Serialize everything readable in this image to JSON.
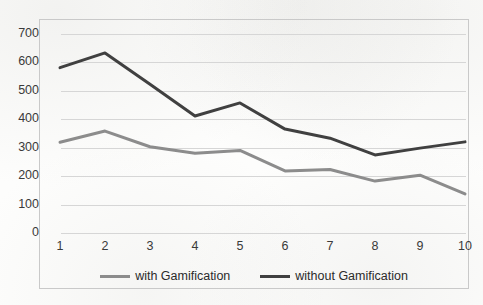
{
  "chart_data": {
    "type": "line",
    "title": "",
    "subtitle": "",
    "xlabel": "",
    "ylabel": "",
    "categories": [
      "1",
      "2",
      "3",
      "4",
      "5",
      "6",
      "7",
      "8",
      "9",
      "10"
    ],
    "x": [
      1,
      2,
      3,
      4,
      5,
      6,
      7,
      8,
      9,
      10
    ],
    "series": [
      {
        "name": "with Gamification",
        "color": "#8c8c8c",
        "values": [
          316,
          355,
          300,
          277,
          287,
          215,
          220,
          179,
          200,
          134
        ]
      },
      {
        "name": "without Gamification",
        "color": "#404040",
        "values": [
          578,
          630,
          520,
          408,
          454,
          362,
          330,
          271,
          295,
          317
        ]
      }
    ],
    "ylim": [
      0,
      700
    ],
    "ytick_step": 100,
    "yticks": [
      "0",
      "100",
      "200",
      "300",
      "400",
      "500",
      "600",
      "700"
    ],
    "xlim": [
      1,
      10
    ],
    "grid": {
      "horizontal": true,
      "vertical": false,
      "color": "#d6d6d6"
    },
    "legend": {
      "position": "bottom",
      "entries": [
        "with Gamification",
        "without Gamification"
      ]
    },
    "plot_border": true,
    "markers": false
  },
  "colors": {
    "background": "#fdfdfc",
    "border": "#c9c9c9",
    "gridline": "#d6d6d6",
    "tick_text": "#3a3a3a",
    "legend_text": "#2b2b2b",
    "series_light": "#8c8c8c",
    "series_dark": "#404040"
  }
}
